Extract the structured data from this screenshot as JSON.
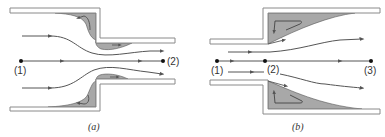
{
  "colors": {
    "wall_fill": "#ffffff",
    "wall_stroke": "#8a8a8a",
    "separation_fill": "#a8a8a8",
    "streamline": "#555555",
    "point": "#111111",
    "text": "#333333"
  },
  "diagram_a": {
    "caption": "(a)",
    "description": "Sudden contraction: flow from wide pipe into narrow pipe with separation regions at corners and vena contracta",
    "points": [
      {
        "label": "(1)"
      },
      {
        "label": "(2)"
      }
    ]
  },
  "diagram_b": {
    "caption": "(b)",
    "description": "Sudden expansion: flow from narrow pipe into wide pipe with large recirculation regions",
    "points": [
      {
        "label": "(1)"
      },
      {
        "label": "(2)"
      },
      {
        "label": "(3)"
      }
    ]
  }
}
